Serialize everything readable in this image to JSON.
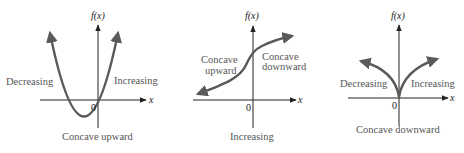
{
  "colors": {
    "axis": "#222222",
    "curve": "#5a5a5a",
    "label": "#555555",
    "background": "#ffffff"
  },
  "panels": [
    {
      "name": "parabola",
      "y_axis_label": "f(x)",
      "x_axis_label": "x",
      "origin_label": "0",
      "left_label": "Decreasing",
      "right_label": "Increasing",
      "bottom_label": "Concave upward"
    },
    {
      "name": "s-curve",
      "y_axis_label": "f(x)",
      "x_axis_label": "x",
      "origin_label": "0",
      "left_label_line1": "Concave",
      "left_label_line2": "upward",
      "right_label_line1": "Concave",
      "right_label_line2": "downward",
      "bottom_label": "Increasing"
    },
    {
      "name": "cusp",
      "y_axis_label": "f(x)",
      "x_axis_label": "x",
      "origin_label": "0",
      "left_label": "Decreasing",
      "right_label": "Increasing",
      "bottom_label": "Concave downward"
    }
  ]
}
